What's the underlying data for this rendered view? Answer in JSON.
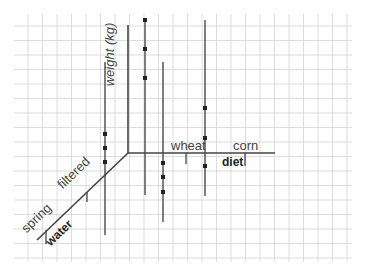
{
  "diagram": {
    "type": "3d-axes-sketch",
    "background": "#ffffff",
    "grid": {
      "color": "#d4d4d4",
      "x_start": 28,
      "x_end": 352,
      "y_start": 20,
      "y_end": 262,
      "step": 14.5
    },
    "axis_color": "#444444",
    "axes": {
      "vertical": {
        "label": "weight (kg)"
      },
      "horizontal": {
        "label": "diet",
        "categories": [
          "wheat",
          "corn"
        ]
      },
      "depth": {
        "label": "water",
        "categories": [
          "spring",
          "filtered"
        ]
      }
    },
    "series": [
      {
        "name": "spring-wheat",
        "x": 105,
        "y_top": 62,
        "y_bottom": 235,
        "points_y": [
          134,
          148,
          162
        ]
      },
      {
        "name": "filtered-wheat",
        "x": 145,
        "y_top": 18,
        "y_bottom": 195,
        "points_y": [
          20,
          49,
          78
        ]
      },
      {
        "name": "spring-corn",
        "x": 163,
        "y_top": 62,
        "y_bottom": 222,
        "points_y": [
          163,
          177,
          192
        ]
      },
      {
        "name": "filtered-corn",
        "x": 205,
        "y_top": 20,
        "y_bottom": 196,
        "points_y": [
          108,
          138,
          166
        ]
      }
    ]
  }
}
